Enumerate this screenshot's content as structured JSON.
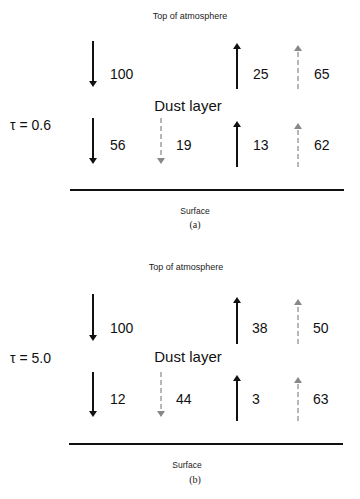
{
  "colors": {
    "solid_arrow": "#111111",
    "dashed_arrow": "#888888",
    "surface_line": "#111111"
  },
  "panels": [
    {
      "caption": "(a)",
      "top_label": "Top of atmosphere",
      "layer_label": "Dust layer",
      "tau_label": "τ = 0.6",
      "surface_label": "Surface",
      "top_row": {
        "down_solid": "100",
        "up_solid": "25",
        "up_dashed": "65"
      },
      "bottom_row": {
        "down_solid": "56",
        "down_dashed": "19",
        "up_solid": "13",
        "up_dashed": "62"
      }
    },
    {
      "caption": "(b)",
      "top_label": "Top of atmosphere",
      "layer_label": "Dust layer",
      "tau_label": "τ = 5.0",
      "surface_label": "Surface",
      "top_row": {
        "down_solid": "100",
        "up_solid": "38",
        "up_dashed": "50"
      },
      "bottom_row": {
        "down_solid": "12",
        "down_dashed": "44",
        "up_solid": "3",
        "up_dashed": "63"
      }
    }
  ]
}
